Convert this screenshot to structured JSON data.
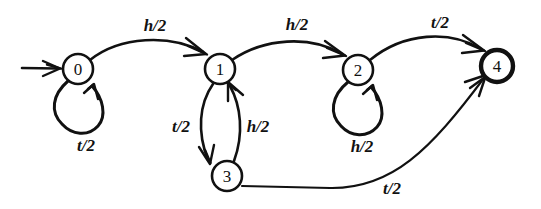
{
  "diagram": {
    "type": "state-transition-diagram",
    "width": 541,
    "height": 209,
    "background_color": "#ffffff",
    "ink_color": "#111111",
    "nodes": [
      {
        "id": "0",
        "label": "0",
        "cx": 78,
        "cy": 69,
        "r": 15,
        "accepting": false
      },
      {
        "id": "1",
        "label": "1",
        "cx": 220,
        "cy": 69,
        "r": 15,
        "accepting": false
      },
      {
        "id": "2",
        "label": "2",
        "cx": 358,
        "cy": 70,
        "r": 15,
        "accepting": false
      },
      {
        "id": "3",
        "label": "3",
        "cx": 227,
        "cy": 176,
        "r": 15,
        "accepting": false
      },
      {
        "id": "4",
        "label": "4",
        "cx": 497,
        "cy": 66,
        "r": 16,
        "accepting": true
      }
    ],
    "start_arrow": {
      "label": "start-arrow",
      "from_x": 22,
      "to_x": 60,
      "y": 68
    },
    "edges": [
      {
        "id": "e-0-1",
        "from": "0",
        "to": "1",
        "label": "h/2",
        "label_x": 155,
        "label_y": 25,
        "kind": "arc"
      },
      {
        "id": "e-1-2",
        "from": "1",
        "to": "2",
        "label": "h/2",
        "label_x": 297,
        "label_y": 24,
        "kind": "arc"
      },
      {
        "id": "e-2-4",
        "from": "2",
        "to": "4",
        "label": "t/2",
        "label_x": 440,
        "label_y": 22,
        "kind": "arc"
      },
      {
        "id": "e-0-0",
        "from": "0",
        "to": "0",
        "label": "t/2",
        "label_x": 86,
        "label_y": 145,
        "kind": "self-loop"
      },
      {
        "id": "e-2-2",
        "from": "2",
        "to": "2",
        "label": "h/2",
        "label_x": 362,
        "label_y": 146,
        "kind": "self-loop"
      },
      {
        "id": "e-1-3",
        "from": "1",
        "to": "3",
        "label": "t/2",
        "label_x": 181,
        "label_y": 126,
        "kind": "curve"
      },
      {
        "id": "e-3-1",
        "from": "3",
        "to": "1",
        "label": "h/2",
        "label_x": 258,
        "label_y": 126,
        "kind": "curve"
      },
      {
        "id": "e-3-4",
        "from": "3",
        "to": "4",
        "label": "t/2",
        "label_x": 392,
        "label_y": 188,
        "kind": "curve"
      }
    ],
    "alphabet": [
      "h",
      "t"
    ],
    "transition_probability": "1/2"
  }
}
